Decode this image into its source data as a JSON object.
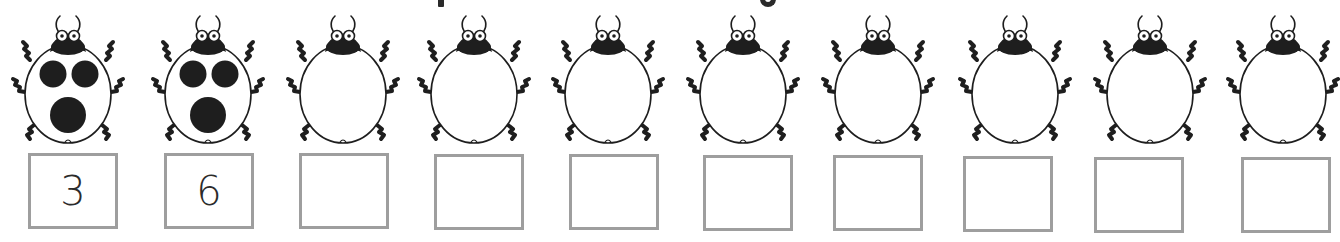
{
  "worksheet": {
    "title_visible_fragments": [
      "p",
      "g"
    ],
    "colors": {
      "ink": "#1e1e1e",
      "box_border": "#9e9e9e",
      "answer_text": "#2b2b2b",
      "background": "#ffffff"
    },
    "ladybugs": [
      {
        "index": 1,
        "spots_visible": 3,
        "answer": "3"
      },
      {
        "index": 2,
        "spots_visible": 3,
        "answer": "6"
      },
      {
        "index": 3,
        "spots_visible": 0,
        "answer": ""
      },
      {
        "index": 4,
        "spots_visible": 0,
        "answer": ""
      },
      {
        "index": 5,
        "spots_visible": 0,
        "answer": ""
      },
      {
        "index": 6,
        "spots_visible": 0,
        "answer": ""
      },
      {
        "index": 7,
        "spots_visible": 0,
        "answer": ""
      },
      {
        "index": 8,
        "spots_visible": 0,
        "answer": ""
      },
      {
        "index": 9,
        "spots_visible": 0,
        "answer": ""
      },
      {
        "index": 10,
        "spots_visible": 0,
        "answer": ""
      }
    ]
  }
}
